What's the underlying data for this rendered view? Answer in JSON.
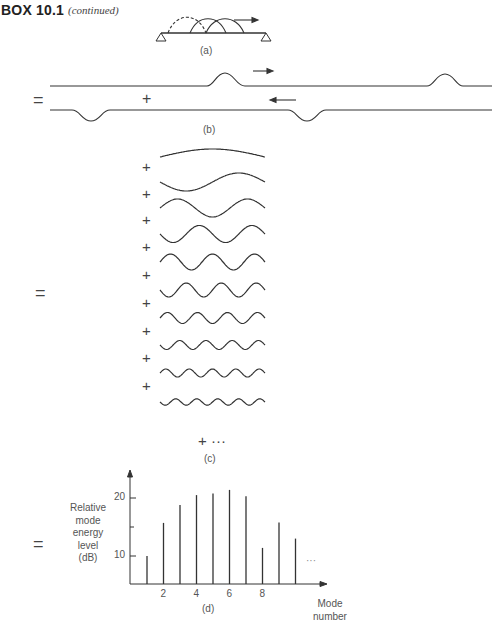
{
  "header": {
    "title": "BOX 10.1",
    "subtitle": "(continued)"
  },
  "panels": {
    "a": {
      "label": "(a)",
      "description": "Pulse traveling right along a beam supported at both ends"
    },
    "b": {
      "label": "(b)",
      "equals": "=",
      "plus": "+",
      "description": "Superposition of an upright pulse traveling right and an inverted pulse traveling left"
    },
    "c": {
      "label": "(c)",
      "equals": "=",
      "plus": "+",
      "tail": "+ ···",
      "mode_count": 10,
      "description": "Sum of standing-wave modes 1 through 10"
    },
    "d": {
      "label": "(d)",
      "equals": "="
    }
  },
  "chart_data": {
    "type": "bar",
    "title": "",
    "xlabel": "Mode number",
    "ylabel": "Relative mode energy level (dB)",
    "categories": [
      1,
      2,
      3,
      4,
      5,
      6,
      7,
      8,
      9,
      10
    ],
    "values": [
      10,
      15.7,
      18.8,
      20.5,
      20.8,
      21.4,
      20.3,
      11.4,
      15.8,
      13.0
    ],
    "x_ticks": [
      "2",
      "4",
      "6",
      "8"
    ],
    "y_ticks": [
      "10",
      "20"
    ],
    "ylim": [
      5,
      23
    ],
    "grid": false,
    "legend": null,
    "annotations": [
      "···"
    ]
  },
  "chart_labels": {
    "ylabel_lines": [
      "Relative",
      "mode",
      "energy",
      "level",
      "(dB)"
    ],
    "xlabel_lines": [
      "Mode",
      "number"
    ],
    "ellipsis": "···"
  }
}
